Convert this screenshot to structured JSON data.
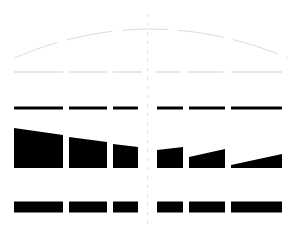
{
  "canvas": {
    "width": 300,
    "height": 236,
    "background": "#ffffff",
    "title": "perspective-dash-diagram"
  },
  "palette": {
    "ink": "#000000",
    "faint_arc": "#dcdcdc",
    "light_dash": "#e8e8e8",
    "center_line": "#dddddd",
    "background": "#ffffff"
  },
  "center_guide": {
    "name": "center-vertical-guide",
    "x": 147.5,
    "y_top": 14,
    "y_bottom": 228,
    "stroke": "#dddddd",
    "width": 1,
    "dash": "3 6"
  },
  "arc": {
    "name": "top-faint-arc",
    "stroke": "#dcdcdc",
    "stroke_width": 1,
    "dash": "46 10",
    "path": "M 14 58 Q 150 0 288 58",
    "apex_x": 150,
    "apex_y": 14,
    "left_end": [
      14,
      58
    ],
    "right_end": [
      288,
      58
    ]
  },
  "rows": [
    {
      "name": "light-dash-row",
      "y": 72,
      "thickness": 2,
      "color": "#e8e8e8",
      "segments": [
        {
          "x": 14,
          "w": 49
        },
        {
          "x": 69,
          "w": 38
        },
        {
          "x": 113,
          "w": 29
        },
        {
          "x": 155,
          "w": 26
        },
        {
          "x": 187,
          "w": 36
        },
        {
          "x": 231,
          "w": 51
        }
      ]
    },
    {
      "name": "black-dash-row",
      "y": 108,
      "thickness": 3,
      "color": "#000000",
      "segments": [
        {
          "x": 14,
          "w": 49
        },
        {
          "x": 69,
          "w": 38
        },
        {
          "x": 113,
          "w": 25
        },
        {
          "x": 157,
          "w": 26
        },
        {
          "x": 189,
          "w": 36
        },
        {
          "x": 231,
          "w": 51
        }
      ]
    },
    {
      "name": "black-bar-row",
      "y": 207,
      "thickness": 11,
      "color": "#000000",
      "segments": [
        {
          "x": 14,
          "w": 49
        },
        {
          "x": 69,
          "w": 38
        },
        {
          "x": 113,
          "w": 25
        },
        {
          "x": 157,
          "w": 26
        },
        {
          "x": 189,
          "w": 36
        },
        {
          "x": 231,
          "w": 51
        }
      ]
    }
  ],
  "wedge_row": {
    "name": "perspective-wedge-row",
    "color": "#000000",
    "baseline_y": 168,
    "wedges": [
      {
        "name": "wedge-1",
        "x1": 14,
        "x2": 63,
        "h_left": 40,
        "h_right": 33
      },
      {
        "name": "wedge-2",
        "x1": 69,
        "x2": 107,
        "h_left": 31,
        "h_right": 26
      },
      {
        "name": "wedge-3",
        "x1": 113,
        "x2": 138,
        "h_left": 24,
        "h_right": 21
      },
      {
        "name": "wedge-4",
        "x1": 157,
        "x2": 183,
        "h_left": 18,
        "h_right": 21
      },
      {
        "name": "wedge-5",
        "x1": 189,
        "x2": 225,
        "h_left": 11,
        "h_right": 19
      },
      {
        "name": "wedge-6",
        "x1": 231,
        "x2": 282,
        "h_left": 3,
        "h_right": 14
      }
    ]
  },
  "chart_data": {
    "type": "bar",
    "title": "",
    "xlabel": "",
    "ylabel": "",
    "categories": [
      "1",
      "2",
      "3",
      "4",
      "5",
      "6"
    ],
    "series": [
      {
        "name": "light-dash-row",
        "values": [
          2,
          2,
          2,
          2,
          2,
          2
        ]
      },
      {
        "name": "black-dash-row",
        "values": [
          3,
          3,
          3,
          3,
          3,
          3
        ]
      },
      {
        "name": "wedge-left-height",
        "values": [
          40,
          31,
          24,
          18,
          11,
          3
        ]
      },
      {
        "name": "wedge-right-height",
        "values": [
          33,
          26,
          21,
          21,
          19,
          14
        ]
      },
      {
        "name": "black-bar-row",
        "values": [
          11,
          11,
          11,
          11,
          11,
          11
        ]
      },
      {
        "name": "segment-width",
        "values": [
          49,
          38,
          25,
          26,
          36,
          51
        ]
      }
    ],
    "grid": false,
    "legend": "none"
  }
}
